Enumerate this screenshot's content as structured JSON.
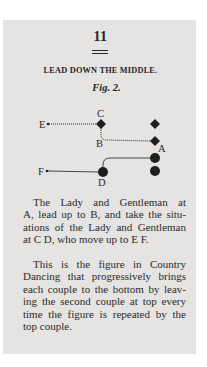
{
  "page": {
    "number": "11",
    "section_title": "LEAD DOWN THE MIDDLE.",
    "figure_label": "Fig. 2.",
    "colors": {
      "paper": "#e5e4e2",
      "ink": "#262626",
      "background": "#ffffff"
    }
  },
  "diagram": {
    "labels": {
      "A": "A",
      "B": "B",
      "C": "C",
      "D": "D",
      "E": "E",
      "F": "F"
    },
    "gentlemen_symbol": "diamond",
    "ladies_symbol": "circle",
    "paths": [
      {
        "from": "E",
        "to": "C",
        "style": "dotted"
      },
      {
        "from": "C",
        "via": "B",
        "to": "A-gentleman",
        "style": "dotted"
      },
      {
        "from": "A-lady",
        "to": "D",
        "style": "solid-curve"
      },
      {
        "from": "F",
        "to": "D",
        "style": "solid"
      }
    ]
  },
  "paragraphs": [
    {
      "lines": [
        "The Lady and Gentleman at",
        "A, lead up to B, and take the situ-",
        "ations of the Lady and Gentleman",
        "at C D, who move up to E F."
      ]
    },
    {
      "lines": [
        "This is the figure in Country",
        "Dancing that progressively brings",
        "each couple to the bottom by leav-",
        "ing the second couple at top every",
        "time the figure is repeated by the",
        "top couple."
      ]
    }
  ]
}
